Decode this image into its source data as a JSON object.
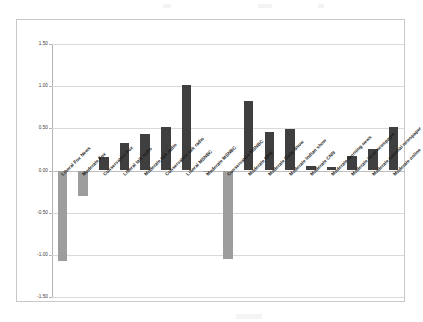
{
  "chart_data": {
    "type": "bar",
    "title": "",
    "subtitle": "",
    "xlabel": "",
    "ylabel": "",
    "ylim": [
      -1.5,
      1.5
    ],
    "ytick_labels": [
      "1.50",
      "1.00",
      "0.50",
      "0.00",
      "-0.50",
      "-1.00",
      "-1.50"
    ],
    "ytick_values": [
      1.5,
      1.0,
      0.5,
      0.0,
      -0.5,
      -1.0,
      -1.5
    ],
    "grid": true,
    "legend": "none",
    "positive_color": "#3f3f3f",
    "negative_color": "#9d9d9d",
    "categories": [
      "Liberal Fox News",
      "Moderate Fox",
      "Conservative Fox",
      "Liberal talk radio",
      "Moderate talk radio",
      "Conservative talk radio",
      "Liberal MSNBC",
      "Moderate MSNBC",
      "Conservative MSNBC",
      "Moderate NPR",
      "Moderate Daily Show",
      "Moderate Indian show",
      "Moderate CNN",
      "Moderate morning news",
      "Moderate local newspaper",
      "Moderate national newspaper",
      "Moderate online"
    ],
    "values": [
      -1.07,
      -0.3,
      0.16,
      0.33,
      0.43,
      0.51,
      1.01,
      -0.01,
      -1.05,
      0.82,
      0.46,
      0.49,
      0.05,
      0.04,
      0.17,
      0.25,
      0.52
    ]
  }
}
